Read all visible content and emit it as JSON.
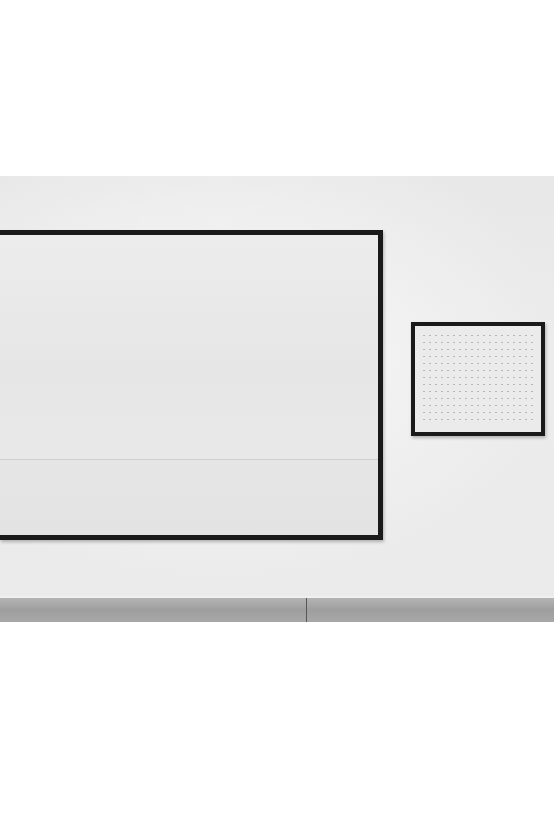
{
  "scene": {
    "description": "Gallery wall photograph with two framed artworks",
    "artworks": [
      {
        "name": "large-white-painting",
        "frame_color": "#1a1a1a",
        "surface_color": "#e9e9e9"
      },
      {
        "name": "small-dotted-artwork",
        "frame_color": "#1a1a1a",
        "surface_color": "#ebebeb"
      }
    ],
    "colors": {
      "page_background": "#ffffff",
      "wall": "#efefef",
      "floor": "#a8a8a8"
    }
  }
}
